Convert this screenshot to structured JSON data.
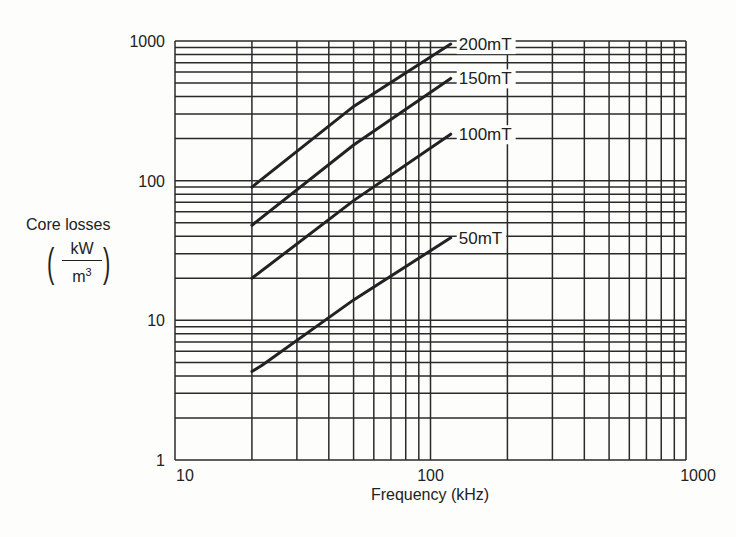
{
  "chart_data": {
    "type": "line",
    "title": "",
    "xlabel": "Frequency (kHz)",
    "ylabel": "Core losses",
    "ylabel_unit": {
      "numerator": "kW",
      "denominator": "m",
      "denominator_exp": "3"
    },
    "x_scale": "log",
    "y_scale": "log",
    "xlim": [
      10,
      1000
    ],
    "ylim": [
      1,
      1000
    ],
    "x_ticks": [
      "10",
      "100",
      "1000"
    ],
    "y_ticks": [
      "1",
      "10",
      "100",
      "1000"
    ],
    "grid": true,
    "legend_position": "inline labels at curve ends",
    "series": [
      {
        "name": "200mT",
        "x": [
          20,
          50,
          120
        ],
        "values": [
          90,
          340,
          950
        ]
      },
      {
        "name": "150mT",
        "x": [
          20,
          50,
          120
        ],
        "values": [
          48,
          180,
          540
        ]
      },
      {
        "name": "100mT",
        "x": [
          20,
          50,
          120
        ],
        "values": [
          20,
          72,
          215
        ]
      },
      {
        "name": "50mT",
        "x": [
          20,
          22,
          50,
          120
        ],
        "values": [
          4.3,
          4.8,
          14,
          39
        ]
      }
    ]
  },
  "colors": {
    "line": "#222222",
    "grid": "#2a2a2a",
    "background": "#fdfdfb"
  }
}
